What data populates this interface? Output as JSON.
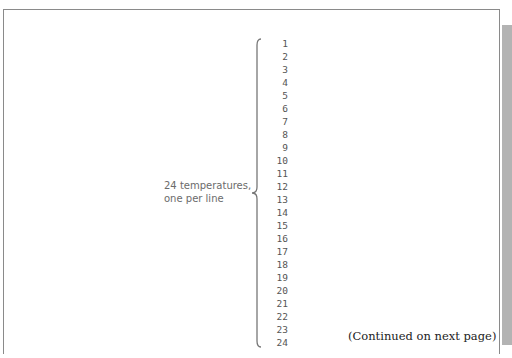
{
  "document": {
    "annotation": {
      "label_line1": "24 temperatures,",
      "label_line2": "one per line"
    },
    "line_numbers": [
      "1",
      "2",
      "3",
      "4",
      "5",
      "6",
      "7",
      "8",
      "9",
      "10",
      "11",
      "12",
      "13",
      "14",
      "15",
      "16",
      "17",
      "18",
      "19",
      "20",
      "21",
      "22",
      "23",
      "24"
    ],
    "footer_note": "(Continued on next page)"
  },
  "colors": {
    "frame_border": "#8a8a8a",
    "side_tab": "#b3b3b3",
    "label_text": "#6b6b6b",
    "number_text": "#555555"
  }
}
